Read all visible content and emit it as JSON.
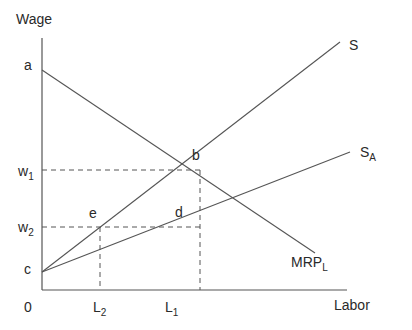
{
  "diagram": {
    "y_axis_label": "Wage",
    "x_axis_label": "Labor",
    "origin_label": "0",
    "y_ticks": [
      {
        "label": "a"
      },
      {
        "label": "w",
        "sub": "1"
      },
      {
        "label": "w",
        "sub": "2"
      },
      {
        "label": "c"
      }
    ],
    "x_ticks": [
      {
        "label": "L",
        "sub": "2"
      },
      {
        "label": "L",
        "sub": "1"
      }
    ],
    "points": {
      "b": "b",
      "d": "d",
      "e": "e"
    },
    "curves": {
      "supply": "S",
      "supply_alt": {
        "label": "S",
        "sub": "A"
      },
      "mrp": {
        "label": "MRP",
        "sub": "L"
      }
    },
    "colors": {
      "line": "#555555",
      "dash": "#555555",
      "text": "#2a2a2a"
    }
  }
}
